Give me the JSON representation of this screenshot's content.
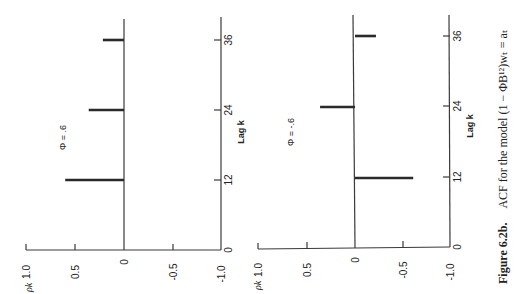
{
  "caption": {
    "label": "Figure 6.2b.",
    "text": "ACF for the model (1 − ΦB¹²)wₜ = aₜ"
  },
  "chart_data": [
    {
      "type": "bar",
      "title": "Φ = .6",
      "xlabel": "Lag k",
      "ylabel": "ρk",
      "x_ticks": [
        0,
        12,
        24,
        36
      ],
      "y_ticks": [
        "1.0",
        "0.5",
        "0",
        "-0.5",
        "-1.0"
      ],
      "ylim": [
        -1.0,
        1.0
      ],
      "orientation": "rotated 90° counter-clockwise",
      "x": [
        12,
        24,
        36
      ],
      "values": [
        0.6,
        0.36,
        0.216
      ]
    },
    {
      "type": "bar",
      "title": "Φ = -.6",
      "xlabel": "Lag k",
      "ylabel": "ρk",
      "x_ticks": [
        0,
        12,
        24,
        36
      ],
      "y_ticks": [
        "1.0",
        "0.5",
        "0",
        "-0.5",
        "-1.0"
      ],
      "ylim": [
        -1.0,
        1.0
      ],
      "orientation": "rotated 90° counter-clockwise",
      "x": [
        12,
        24,
        36
      ],
      "values": [
        -0.6,
        0.36,
        -0.216
      ]
    }
  ],
  "panels": [
    {
      "phi_label": "Φ = .6",
      "lag_label": "Lag k",
      "rho_label": "ρk",
      "ytick_labels": [
        "1.0",
        "0.5",
        "0",
        "-0.5",
        "-1.0"
      ],
      "xtick_labels": [
        "0",
        "12",
        "24",
        "36"
      ]
    },
    {
      "phi_label": "Φ = -.6",
      "lag_label": "Lag k",
      "rho_label": "ρk",
      "ytick_labels": [
        "1.0",
        "0.5",
        "0",
        "-0.5",
        "-1.0"
      ],
      "xtick_labels": [
        "0",
        "12",
        "24",
        "36"
      ]
    }
  ]
}
